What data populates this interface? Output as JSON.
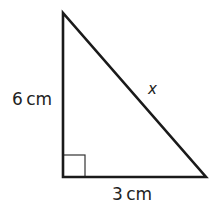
{
  "diagram": {
    "type": "right-triangle",
    "vertices": {
      "top": [
        63,
        13
      ],
      "right_angle": [
        63,
        177
      ],
      "right": [
        206,
        177
      ]
    },
    "right_angle_marker_size": 22,
    "stroke_color": "#1a1a1a",
    "marker_color": "#333333",
    "labels": {
      "vertical_side": "6 cm",
      "horizontal_side": "3 cm",
      "hypotenuse": "x"
    }
  }
}
